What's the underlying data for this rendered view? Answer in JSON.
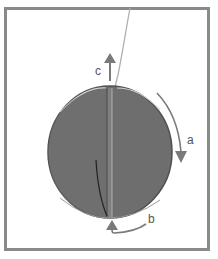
{
  "diagram": {
    "labels": {
      "a": "a",
      "b": "b",
      "c": "c"
    },
    "colors": {
      "frame": "#8a8a8a",
      "disc": "#6f6f6f",
      "disc_edge": "#5a5a5a",
      "arrow": "#7a7a7a",
      "string": "#b5b5b5"
    }
  }
}
